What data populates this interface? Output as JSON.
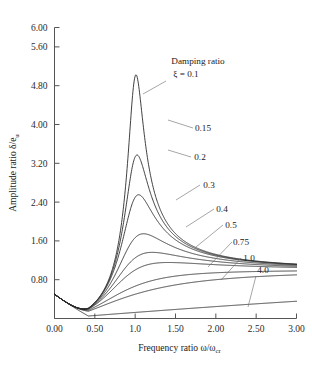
{
  "chart_data": {
    "type": "line",
    "title": "",
    "xlabel": "Frequency ratio  ω/ω",
    "xlabel_sub": "cr",
    "ylabel": "Amplitude ratio δ/e",
    "ylabel_sub": "u",
    "xlim": [
      0.0,
      3.0
    ],
    "ylim": [
      0.0,
      6.0
    ],
    "grid": false,
    "legend_position": "annotations-inline",
    "xticks": [
      "0.00",
      "0.50",
      "1.0",
      "1.50",
      "2.00",
      "2.50",
      "3.00"
    ],
    "xtick_values": [
      0.0,
      0.5,
      1.0,
      1.5,
      2.0,
      2.5,
      3.0
    ],
    "yticks": [
      "0.80",
      "1.60",
      "2.40",
      "3.20",
      "4.00",
      "4.80",
      "5.60",
      "6.00"
    ],
    "ytick_values": [
      0.8,
      1.6,
      2.4,
      3.2,
      4.0,
      4.8,
      5.6,
      6.0
    ],
    "annotation_title": "Damping ratio",
    "annotation_symbol": "ξ = 0.1",
    "series": [
      {
        "name": "ξ = 0.1",
        "zeta": 0.1,
        "peak_x": 1.01,
        "peak_y": 5.55
      },
      {
        "name": "0.15",
        "zeta": 0.15,
        "peak_x": 1.02,
        "peak_y": 3.72
      },
      {
        "name": "0.2",
        "zeta": 0.2,
        "peak_x": 1.04,
        "peak_y": 2.8
      },
      {
        "name": "0.3",
        "zeta": 0.3,
        "peak_x": 1.1,
        "peak_y": 1.92
      },
      {
        "name": "0.4",
        "zeta": 0.4,
        "peak_x": 1.19,
        "peak_y": 1.55
      },
      {
        "name": "0.5",
        "zeta": 0.5,
        "peak_x": 1.41,
        "peak_y": 1.33
      },
      {
        "name": "0.75",
        "zeta": 0.75,
        "peak_x": 2.2,
        "peak_y": 1.03
      },
      {
        "name": "1.0",
        "zeta": 1.0,
        "peak_x": 3.0,
        "peak_y": 0.92
      },
      {
        "name": "4.0",
        "zeta": 4.0,
        "peak_x": 3.0,
        "peak_y": 0.36
      }
    ],
    "series_labels": [
      "0.15",
      "0.2",
      "0.3",
      "0.4",
      "0.5",
      "0.75",
      "1.0",
      "4.0"
    ],
    "curve_start_y": 0.5,
    "asymptote_y": 1.0
  }
}
